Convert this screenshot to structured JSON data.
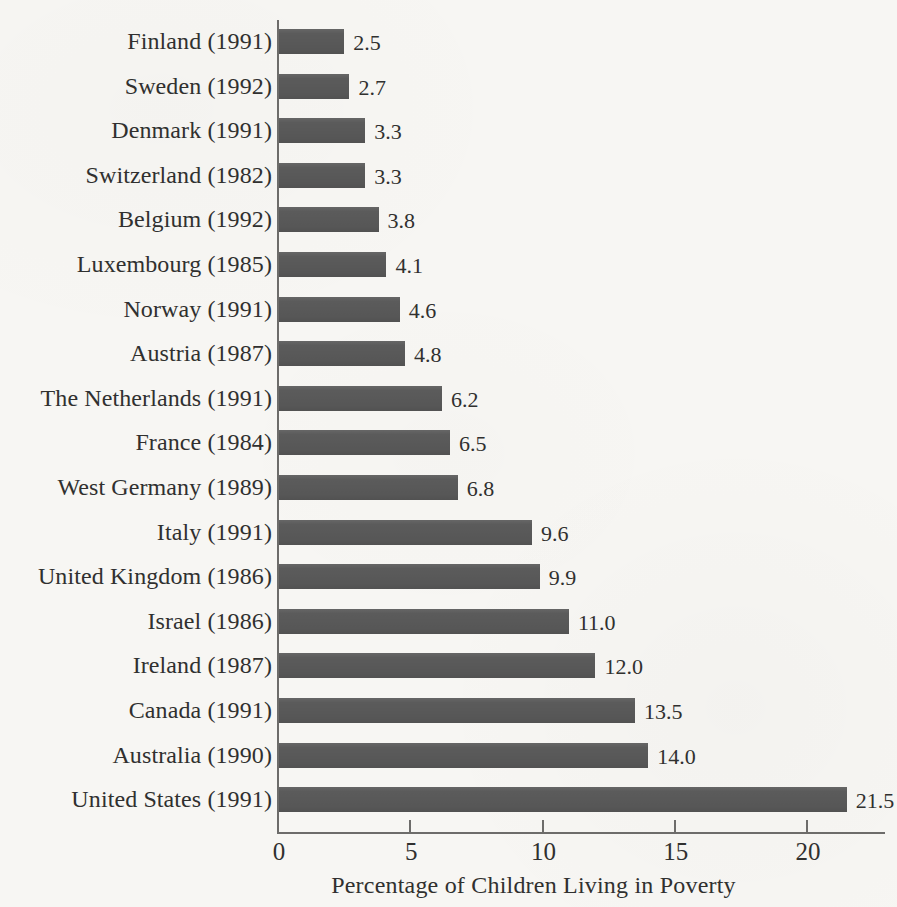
{
  "chart_data": {
    "type": "bar",
    "orientation": "horizontal",
    "title": "",
    "xlabel": "Percentage of Children Living in Poverty",
    "ylabel": "",
    "xlim": [
      0,
      23
    ],
    "grid": false,
    "legend": null,
    "xticks": [
      "0",
      "5",
      "10",
      "15",
      "20"
    ],
    "xtick_values": [
      0,
      5,
      10,
      15,
      20
    ],
    "categories": [
      "Finland (1991)",
      "Sweden (1992)",
      "Denmark (1991)",
      "Switzerland (1982)",
      "Belgium (1992)",
      "Luxembourg (1985)",
      "Norway (1991)",
      "Austria (1987)",
      "The Netherlands (1991)",
      "France (1984)",
      "West Germany (1989)",
      "Italy (1991)",
      "United Kingdom (1986)",
      "Israel (1986)",
      "Ireland (1987)",
      "Canada (1991)",
      "Australia (1990)",
      "United States (1991)"
    ],
    "values": [
      2.5,
      2.7,
      3.3,
      3.3,
      3.8,
      4.1,
      4.6,
      4.8,
      6.2,
      6.5,
      6.8,
      9.6,
      9.9,
      11.0,
      12.0,
      13.5,
      14.0,
      21.5
    ],
    "value_labels": [
      "2.5",
      "2.7",
      "3.3",
      "3.3",
      "3.8",
      "4.1",
      "4.6",
      "4.8",
      "6.2",
      "6.5",
      "6.8",
      "9.6",
      "9.9",
      "11.0",
      "12.0",
      "13.5",
      "14.0",
      "21.5"
    ],
    "bar_color": "#5b5b5b",
    "background_color": "#f7f6f3",
    "axis_color": "#6d6c6a",
    "text_color": "#30302f"
  }
}
